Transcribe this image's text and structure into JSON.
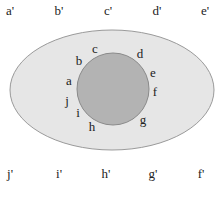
{
  "diagram": {
    "colors": {
      "ellipse_fill": "#e6e6e6",
      "ellipse_stroke": "#9a9a9a",
      "circle_fill": "#b3b3b3",
      "circle_stroke": "#8a8a8a",
      "text": "#222222"
    },
    "outer_ellipse": {
      "cx": 112,
      "cy": 90,
      "rx": 102,
      "ry": 60
    },
    "inner_circle": {
      "cx": 113,
      "cy": 89,
      "r": 36
    },
    "top_row_labels": [
      {
        "text": "a'",
        "x": 10,
        "y": 12
      },
      {
        "text": "b'",
        "x": 59,
        "y": 12
      },
      {
        "text": "c'",
        "x": 108,
        "y": 12
      },
      {
        "text": "d'",
        "x": 157,
        "y": 12
      },
      {
        "text": "e'",
        "x": 205,
        "y": 12
      }
    ],
    "bottom_row_labels": [
      {
        "text": "j'",
        "x": 10,
        "y": 175
      },
      {
        "text": "i'",
        "x": 59,
        "y": 175
      },
      {
        "text": "h'",
        "x": 106,
        "y": 175
      },
      {
        "text": "g'",
        "x": 153,
        "y": 175
      },
      {
        "text": "f'",
        "x": 201,
        "y": 175
      }
    ],
    "circle_labels": [
      {
        "text": "a",
        "x": 69,
        "y": 82
      },
      {
        "text": "b",
        "x": 79,
        "y": 62
      },
      {
        "text": "c",
        "x": 95,
        "y": 50
      },
      {
        "text": "d",
        "x": 140,
        "y": 55
      },
      {
        "text": "e",
        "x": 153,
        "y": 74
      },
      {
        "text": "f",
        "x": 155,
        "y": 93
      },
      {
        "text": "g",
        "x": 143,
        "y": 121
      },
      {
        "text": "h",
        "x": 92,
        "y": 128
      },
      {
        "text": "i",
        "x": 78,
        "y": 114
      },
      {
        "text": "j",
        "x": 67,
        "y": 102
      }
    ]
  }
}
